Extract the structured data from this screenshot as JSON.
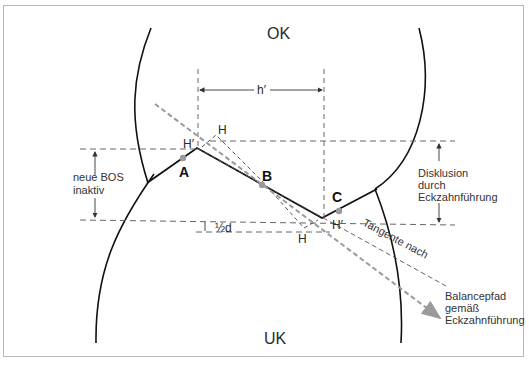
{
  "diagram": {
    "labels": {
      "upper_jaw": "OK",
      "lower_jaw": "UK",
      "h_prime": "h′",
      "half_d": "½d",
      "point_a": "A",
      "point_b": "B",
      "point_c": "C",
      "h_upper": "H",
      "h_prime_left": "H′",
      "h_lower": "H",
      "h_prime_right": "H′",
      "tangente": "Tangente nach",
      "neue_bos_line1": "neue BOS",
      "neue_bos_line2": "inaktiv",
      "disklusion_line1": "Disklusion",
      "disklusion_line2": "durch",
      "disklusion_line3": "Eckzahnführung",
      "balance_line1": "Balancepfad",
      "balance_line2": "gemäß",
      "balance_line3": "Eckzahnführung"
    },
    "colors": {
      "line": "#111111",
      "dashed": "#555555",
      "gray_path": "#9a9a9a",
      "point": "#9a9a9a",
      "border": "#b8b8b8"
    }
  }
}
